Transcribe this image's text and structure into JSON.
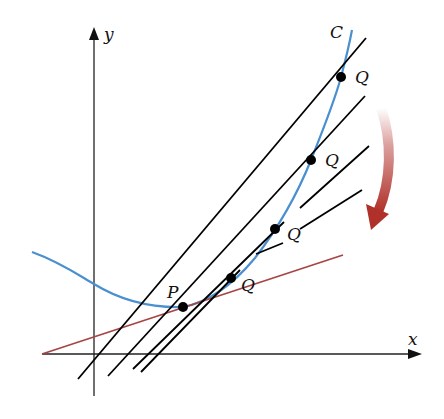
{
  "diagram": {
    "colors": {
      "curve": "#4a8fd0",
      "tangent": "#a84444",
      "secant": "#000000",
      "axis": "#222222",
      "arrow": "#b0302a"
    },
    "labels": {
      "x_axis": "x",
      "y_axis": "y",
      "curve": "C",
      "point_p": "P",
      "point_q1": "Q",
      "point_q2": "Q",
      "point_q3": "Q",
      "point_q4": "Q"
    },
    "points": {
      "P": [
        183,
        307
      ],
      "Q": [
        [
          341,
          77
        ],
        [
          311,
          160
        ],
        [
          275,
          229
        ],
        [
          231,
          278
        ]
      ]
    }
  }
}
